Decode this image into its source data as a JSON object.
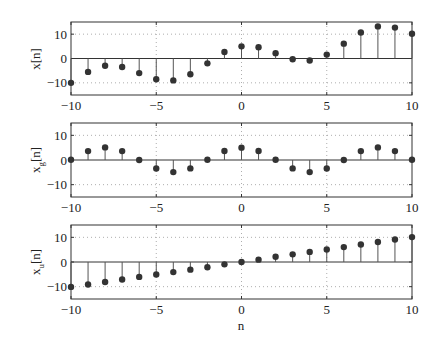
{
  "chart_data": [
    {
      "type": "stem",
      "title": "",
      "xlabel": "",
      "ylabel": "x[n]",
      "ylabel_main": "x",
      "ylabel_sub": "",
      "xlim": [
        -10,
        10
      ],
      "ylim": [
        -15,
        15
      ],
      "xticks": [
        -10,
        -5,
        0,
        5,
        10
      ],
      "yticks": [
        -10,
        0,
        10
      ],
      "grid": "dotted",
      "x": [
        -10,
        -9,
        -8,
        -7,
        -6,
        -5,
        -4,
        -3,
        -2,
        -1,
        0,
        1,
        2,
        3,
        4,
        5,
        6,
        7,
        8,
        9,
        10
      ],
      "values": [
        -10,
        -5.5,
        -3,
        -3.5,
        -6,
        -8.5,
        -9,
        -6.5,
        -2,
        2.7,
        5,
        4.6,
        2.2,
        -0.3,
        -0.8,
        1.6,
        6.1,
        10.7,
        13.2,
        12.7,
        10.2
      ]
    },
    {
      "type": "stem",
      "title": "",
      "xlabel": "",
      "ylabel": "x_g[n]",
      "ylabel_main": "x",
      "ylabel_sub": "g",
      "xlim": [
        -10,
        10
      ],
      "ylim": [
        -15,
        15
      ],
      "xticks": [
        -10,
        -5,
        0,
        5,
        10
      ],
      "yticks": [
        -10,
        0,
        10
      ],
      "grid": "dotted",
      "x": [
        -10,
        -9,
        -8,
        -7,
        -6,
        -5,
        -4,
        -3,
        -2,
        -1,
        0,
        1,
        2,
        3,
        4,
        5,
        6,
        7,
        8,
        9,
        10
      ],
      "values": [
        0.1,
        3.6,
        5.1,
        3.6,
        0,
        -3.45,
        -4.9,
        -3.4,
        0.1,
        3.65,
        5,
        3.65,
        0.1,
        -3.4,
        -4.9,
        -3.45,
        0,
        3.6,
        5.1,
        3.6,
        0.1
      ]
    },
    {
      "type": "stem",
      "title": "",
      "xlabel": "n",
      "ylabel": "x_u[n]",
      "ylabel_main": "x",
      "ylabel_sub": "u",
      "xlim": [
        -10,
        10
      ],
      "ylim": [
        -15,
        15
      ],
      "xticks": [
        -10,
        -5,
        0,
        5,
        10
      ],
      "yticks": [
        -10,
        0,
        10
      ],
      "grid": "dotted",
      "x": [
        -10,
        -9,
        -8,
        -7,
        -6,
        -5,
        -4,
        -3,
        -2,
        -1,
        0,
        1,
        2,
        3,
        4,
        5,
        6,
        7,
        8,
        9,
        10
      ],
      "values": [
        -10.1,
        -9.1,
        -8.1,
        -7.1,
        -6.05,
        -5.05,
        -4.1,
        -3.1,
        -2.1,
        -0.95,
        0,
        0.95,
        2.1,
        3.1,
        4.1,
        5.05,
        6.05,
        7.1,
        8.1,
        9.1,
        10.1
      ]
    }
  ],
  "labels": {
    "panel1_ylabel": "x[n]",
    "panel2_ylabel_main": "x",
    "panel2_ylabel_sub": "g",
    "panel2_ylabel_rest": "[n]",
    "panel3_ylabel_main": "x",
    "panel3_ylabel_sub": "u",
    "panel3_ylabel_rest": "[n]",
    "xlabel": "n"
  },
  "colors": {
    "axis": "#333333",
    "stem": "#555555",
    "marker": "#333333",
    "grid": "#999999"
  }
}
